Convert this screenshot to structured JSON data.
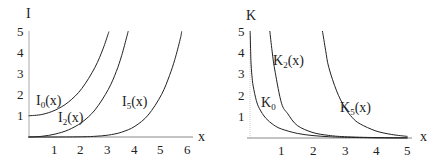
{
  "chart_data": [
    {
      "type": "line",
      "title": "",
      "xlabel": "x",
      "ylabel": "I",
      "xlim": [
        0,
        6
      ],
      "ylim": [
        0,
        5
      ],
      "x_ticks": [
        "1",
        "2",
        "3",
        "4",
        "5",
        "6"
      ],
      "y_ticks": [
        "1",
        "2",
        "3",
        "4",
        "5"
      ],
      "grid": false,
      "series": [
        {
          "name": "I0(x)",
          "label_main": "I",
          "label_sub": "0",
          "label_tail": "(x)",
          "points": [
            [
              0,
              1
            ],
            [
              0.5,
              1.063
            ],
            [
              1,
              1.266
            ],
            [
              1.5,
              1.647
            ],
            [
              2,
              2.28
            ],
            [
              2.5,
              3.29
            ],
            [
              2.8,
              4.157
            ],
            [
              3.0,
              4.881
            ],
            [
              3.02,
              4.96
            ]
          ]
        },
        {
          "name": "I2(x)",
          "label_main": "I",
          "label_sub": "2",
          "label_tail": "(x)",
          "points": [
            [
              0,
              0
            ],
            [
              0.5,
              0.032
            ],
            [
              1,
              0.136
            ],
            [
              1.5,
              0.337
            ],
            [
              2,
              0.689
            ],
            [
              2.5,
              1.277
            ],
            [
              3,
              2.245
            ],
            [
              3.3,
              3.09
            ],
            [
              3.5,
              3.832
            ],
            [
              3.7,
              4.75
            ],
            [
              3.75,
              5.0
            ]
          ]
        },
        {
          "name": "I5(x)",
          "label_main": "I",
          "label_sub": "5",
          "label_tail": "(x)",
          "points": [
            [
              0,
              0
            ],
            [
              1,
              0.0003
            ],
            [
              2,
              0.0098
            ],
            [
              2.5,
              0.0319
            ],
            [
              3,
              0.0912
            ],
            [
              3.5,
              0.226
            ],
            [
              4,
              0.505
            ],
            [
              4.5,
              1.04
            ],
            [
              5,
              2.0
            ],
            [
              5.3,
              2.9
            ],
            [
              5.5,
              3.65
            ],
            [
              5.7,
              4.6
            ],
            [
              5.76,
              4.98
            ]
          ]
        }
      ]
    },
    {
      "type": "line",
      "title": "",
      "xlabel": "x",
      "ylabel": "K",
      "xlim": [
        0,
        5
      ],
      "ylim": [
        0,
        5
      ],
      "x_ticks": [
        "1",
        "2",
        "3",
        "4",
        "5"
      ],
      "y_ticks": [
        "1",
        "2",
        "3",
        "4",
        "5"
      ],
      "grid": false,
      "series": [
        {
          "name": "K0",
          "label_main": "K",
          "label_sub": "0",
          "label_tail": "",
          "points": [
            [
              0.005,
              5.0
            ],
            [
              0.01,
              4.72
            ],
            [
              0.03,
              3.62
            ],
            [
              0.06,
              2.93
            ],
            [
              0.1,
              2.427
            ],
            [
              0.2,
              1.753
            ],
            [
              0.3,
              1.372
            ],
            [
              0.5,
              0.924
            ],
            [
              0.75,
              0.611
            ],
            [
              1,
              0.421
            ],
            [
              1.5,
              0.214
            ],
            [
              2,
              0.114
            ],
            [
              2.5,
              0.062
            ],
            [
              3,
              0.035
            ],
            [
              4,
              0.011
            ],
            [
              5,
              0.004
            ]
          ]
        },
        {
          "name": "K2(x)",
          "label_main": "K",
          "label_sub": "2",
          "label_tail": "(x)",
          "points": [
            [
              0.63,
              5.0
            ],
            [
              0.7,
              4.06
            ],
            [
              0.8,
              3.07
            ],
            [
              1,
              1.625
            ],
            [
              1.2,
              1.132
            ],
            [
              1.5,
              0.584
            ],
            [
              2,
              0.254
            ],
            [
              2.5,
              0.122
            ],
            [
              3,
              0.0615
            ],
            [
              4,
              0.0174
            ],
            [
              5,
              0.0053
            ]
          ]
        },
        {
          "name": "K5(x)",
          "label_main": "K",
          "label_sub": "5",
          "label_tail": "(x)",
          "points": [
            [
              2.3,
              5.0
            ],
            [
              2.4,
              4.1
            ],
            [
              2.5,
              3.3
            ],
            [
              2.75,
              2.2
            ],
            [
              3,
              1.44
            ],
            [
              3.25,
              0.95
            ],
            [
              3.5,
              0.655
            ],
            [
              4,
              0.328
            ],
            [
              4.5,
              0.165
            ],
            [
              5,
              0.0733
            ]
          ]
        }
      ]
    }
  ],
  "labels": {
    "left_ylabel": "I",
    "left_xlabel": "x",
    "right_ylabel": "K",
    "right_xlabel": "x",
    "I0": {
      "main": "I",
      "sub": "0",
      "tail": "(x)"
    },
    "I2": {
      "main": "I",
      "sub": "2",
      "tail": "(x)"
    },
    "I5": {
      "main": "I",
      "sub": "5",
      "tail": "(x)"
    },
    "K0": {
      "main": "K",
      "sub": "0",
      "tail": ""
    },
    "K2": {
      "main": "K",
      "sub": "2",
      "tail": "(x)"
    },
    "K5": {
      "main": "K",
      "sub": "5",
      "tail": "(x)"
    },
    "left_x_ticks": [
      "1",
      "2",
      "3",
      "4",
      "5",
      "6"
    ],
    "left_y_ticks": [
      "1",
      "2",
      "3",
      "4",
      "5"
    ],
    "right_x_ticks": [
      "1",
      "2",
      "3",
      "4",
      "5"
    ],
    "right_y_ticks": [
      "1",
      "2",
      "3",
      "4",
      "5"
    ]
  }
}
